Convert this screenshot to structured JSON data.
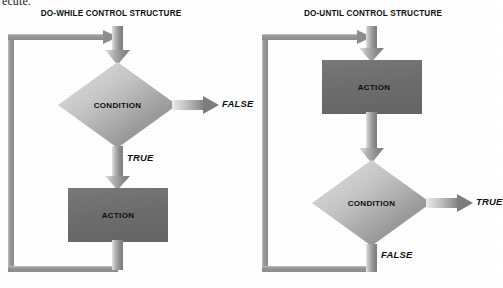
{
  "page": {
    "clipped_body_text": "ecute.",
    "background_color": "#ffffff"
  },
  "palette": {
    "line_gray": "#8d8d8d",
    "line_highlight": "#c9c9c9",
    "action_fill": "#6f6f6f",
    "diamond_light": "#d6d6d6",
    "diamond_dark": "#8a8a8a",
    "text_dark": "#111111"
  },
  "diagrams": [
    {
      "id": "do-while",
      "title": "DO-WHILE CONTROL STRUCTURE",
      "decision": {
        "label": "CONDITION",
        "shape": "diamond"
      },
      "process": {
        "label": "ACTION",
        "shape": "rectangle"
      },
      "branches": [
        {
          "label": "FALSE",
          "direction": "right",
          "from": "condition",
          "exits_loop": true
        },
        {
          "label": "TRUE",
          "direction": "down",
          "from": "condition",
          "exits_loop": false
        }
      ],
      "loop_back": {
        "from": "action",
        "to": "entry",
        "path": "left-up"
      },
      "order": [
        "entry",
        "condition",
        "action",
        "loop-back"
      ]
    },
    {
      "id": "do-until",
      "title": "DO-UNTIL CONTROL STRUCTURE",
      "decision": {
        "label": "CONDITION",
        "shape": "diamond"
      },
      "process": {
        "label": "ACTION",
        "shape": "rectangle"
      },
      "branches": [
        {
          "label": "TRUE",
          "direction": "right",
          "from": "condition",
          "exits_loop": true
        },
        {
          "label": "FALSE",
          "direction": "down",
          "from": "condition",
          "exits_loop": false
        }
      ],
      "loop_back": {
        "from": "condition",
        "to": "entry",
        "path": "left-up"
      },
      "order": [
        "entry",
        "action",
        "condition",
        "loop-back"
      ]
    }
  ]
}
